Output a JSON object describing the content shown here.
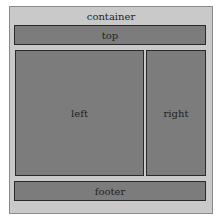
{
  "diagram": {
    "container": {
      "label": "container"
    },
    "top": {
      "label": "top"
    },
    "left": {
      "label": "left"
    },
    "right": {
      "label": "right"
    },
    "footer": {
      "label": "footer"
    }
  },
  "colors": {
    "container_bg": "#c9c9c9",
    "panel_bg": "#7c7c7c",
    "panel_border": "#2a2a2a"
  }
}
